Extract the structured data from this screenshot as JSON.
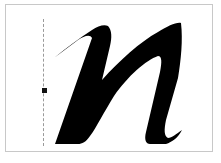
{
  "canvas": {
    "glyph_char": "n",
    "glyph_style": "italic script",
    "glyph_color": "#000000",
    "frame_border_color": "#c8c8c8",
    "background_color": "#ffffff"
  },
  "guide": {
    "type": "vertical-dashed",
    "color": "#9a9a9a",
    "handle_color": "#111111"
  }
}
